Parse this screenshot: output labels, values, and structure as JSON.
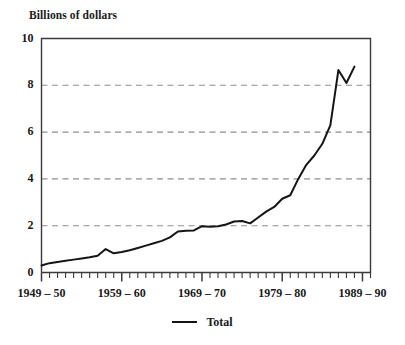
{
  "chart_data": {
    "type": "line",
    "title": "Billions of dollars",
    "xlabel": "",
    "ylabel": "Billions of dollars",
    "ylim": [
      0,
      10
    ],
    "yticks": [
      0,
      2,
      4,
      6,
      8,
      10
    ],
    "ytick_labels": [
      "0",
      "2",
      "4",
      "6",
      "8",
      "10"
    ],
    "gridlines": [
      2,
      4,
      6,
      8
    ],
    "grid": true,
    "grid_style": "dashed-horizontal",
    "xlim": [
      1949,
      1990
    ],
    "xtick_labels": [
      "1949 – 50",
      "1959 – 60",
      "1969 – 70",
      "1979 – 80",
      "1989 – 90"
    ],
    "xtick_positions": [
      1949,
      1959,
      1969,
      1979,
      1989
    ],
    "minor_tick_interval": 1,
    "legend_position": "bottom-center",
    "series": [
      {
        "name": "Total",
        "color": "#151515",
        "x": [
          1949,
          1950,
          1951,
          1952,
          1953,
          1954,
          1955,
          1956,
          1957,
          1958,
          1959,
          1960,
          1961,
          1962,
          1963,
          1964,
          1965,
          1966,
          1967,
          1968,
          1969,
          1970,
          1971,
          1972,
          1973,
          1974,
          1975,
          1976,
          1977,
          1978,
          1979,
          1980,
          1981,
          1982,
          1983,
          1984,
          1985,
          1986,
          1987
        ],
        "values": [
          0.3,
          0.4,
          0.45,
          0.5,
          0.55,
          0.6,
          0.65,
          0.72,
          1.0,
          0.82,
          0.88,
          0.95,
          1.05,
          1.15,
          1.25,
          1.35,
          1.5,
          1.75,
          1.78,
          1.8,
          1.98,
          1.95,
          1.98,
          2.05,
          2.18,
          2.2,
          2.1,
          2.35,
          2.6,
          2.8,
          3.15,
          3.3,
          4.0,
          4.6,
          5.0,
          5.5,
          6.3,
          8.65,
          8.1
        ],
        "final_x": 1988,
        "final_value": 8.8
      }
    ],
    "annotations": []
  },
  "legend": {
    "items": [
      {
        "label": "Total",
        "marker": "line-swatch"
      }
    ]
  },
  "colors": {
    "line": "#151515",
    "axis": "#3a3a3a",
    "grid": "#8f8f8f",
    "text": "#1a1a1a",
    "background": "#ffffff"
  }
}
